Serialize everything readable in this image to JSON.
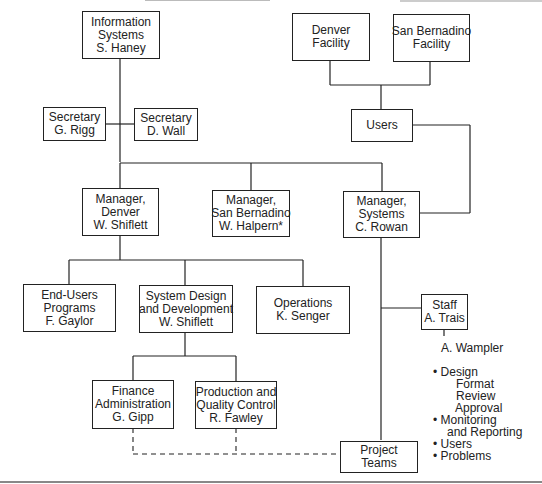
{
  "diagram": {
    "type": "org-chart",
    "nodes": {
      "info_systems": {
        "lines": [
          "Information",
          "Systems",
          "S. Haney"
        ]
      },
      "secretary_rigg": {
        "lines": [
          "Secretary",
          "G. Rigg"
        ]
      },
      "secretary_wall": {
        "lines": [
          "Secretary",
          "D. Wall"
        ]
      },
      "denver_facility": {
        "lines": [
          "Denver",
          "Facility"
        ]
      },
      "sanbernadino_facility": {
        "lines": [
          "San Bernadino",
          "Facility"
        ]
      },
      "users": {
        "lines": [
          "Users"
        ]
      },
      "mgr_denver": {
        "lines": [
          "Manager,",
          "Denver",
          "W. Shiflett"
        ]
      },
      "mgr_sanbernadino": {
        "lines": [
          "Manager,",
          "San Bernadino",
          "W. Halpern*"
        ]
      },
      "mgr_systems": {
        "lines": [
          "Manager,",
          "Systems",
          "C. Rowan"
        ]
      },
      "end_users": {
        "lines": [
          "End-Users",
          "Programs",
          "F. Gaylor"
        ]
      },
      "system_design": {
        "lines": [
          "System Design",
          "and Development",
          "W. Shiflett"
        ]
      },
      "operations": {
        "lines": [
          "Operations",
          "K. Senger"
        ]
      },
      "staff": {
        "lines": [
          "Staff",
          "A. Trais"
        ]
      },
      "finance": {
        "lines": [
          "Finance",
          "Administration",
          "G. Gipp"
        ]
      },
      "production": {
        "lines": [
          "Production and",
          "Quality Control",
          "R. Fawley"
        ]
      },
      "project_teams": {
        "lines": [
          "Project",
          "Teams"
        ]
      }
    },
    "staff_notes": {
      "name": "A. Wampler",
      "items": [
        {
          "bullet": "•",
          "text": "Design"
        },
        {
          "bullet": "",
          "text": "Format",
          "indent": 2
        },
        {
          "bullet": "",
          "text": "Review",
          "indent": 2
        },
        {
          "bullet": "",
          "text": "Approval",
          "indent": 2
        },
        {
          "bullet": "•",
          "text": "Monitoring"
        },
        {
          "bullet": "",
          "text": "and Reporting",
          "indent": 1
        },
        {
          "bullet": "•",
          "text": "Users"
        },
        {
          "bullet": "•",
          "text": "Problems"
        }
      ]
    },
    "colors": {
      "line": "#222222",
      "background": "#ffffff"
    }
  }
}
